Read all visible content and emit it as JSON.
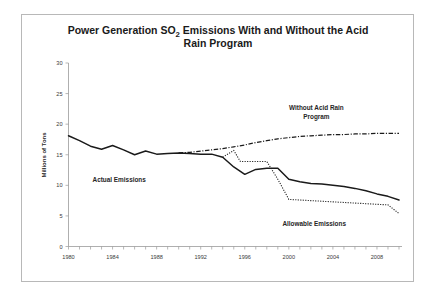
{
  "chart_data": {
    "type": "line",
    "title": "Power Generation SO2 Emissions With and Without the Acid Rain Program",
    "title_line1_pre": "Power Generation SO",
    "title_line1_sub": "2",
    "title_line1_post": " Emissions With and Without the Acid",
    "title_line2": "Rain Program",
    "xlabel": "",
    "ylabel": "Millions of Tons",
    "xlim": [
      1980,
      2010
    ],
    "ylim": [
      0,
      30
    ],
    "yticks": [
      0,
      5,
      10,
      15,
      20,
      25,
      30
    ],
    "ytick_labels": [
      "0",
      "5",
      "10",
      "15",
      "20",
      "25",
      "30"
    ],
    "xticks": [
      1980,
      1981,
      1982,
      1983,
      1984,
      1985,
      1986,
      1987,
      1988,
      1989,
      1990,
      1991,
      1992,
      1993,
      1994,
      1995,
      1996,
      1997,
      1998,
      1999,
      2000,
      2001,
      2002,
      2003,
      2004,
      2005,
      2006,
      2007,
      2008,
      2009,
      2010
    ],
    "xtick_labels_shown": [
      "1980",
      "1984",
      "1988",
      "1992",
      "1996",
      "2000",
      "2004",
      "2008"
    ],
    "xtick_label_years": [
      1980,
      1984,
      1988,
      1992,
      1996,
      2000,
      2004,
      2008
    ],
    "grid": false,
    "legend": "annotations",
    "series": [
      {
        "name": "Actual Emissions",
        "style": "solid",
        "annotation": "Actual Emissions",
        "annotation_x": 1984.6,
        "annotation_y": 10.5,
        "x": [
          1980,
          1981,
          1982,
          1983,
          1984,
          1985,
          1986,
          1987,
          1988,
          1989,
          1990,
          1991,
          1992,
          1993,
          1994,
          1995,
          1996,
          1997,
          1998,
          1999,
          2000,
          2001,
          2002,
          2003,
          2004,
          2005,
          2006,
          2007,
          2008,
          2009,
          2010
        ],
        "y": [
          18.1,
          17.3,
          16.4,
          15.9,
          16.5,
          15.8,
          15.0,
          15.6,
          15.1,
          15.2,
          15.3,
          15.2,
          15.1,
          15.1,
          14.6,
          13.0,
          11.8,
          12.6,
          12.8,
          12.8,
          11.0,
          10.6,
          10.3,
          10.2,
          10.0,
          9.8,
          9.5,
          9.1,
          8.6,
          8.2,
          7.6
        ]
      },
      {
        "name": "Without Acid Rain Program",
        "style": "dash-dot",
        "annotation_line1": "Without Acid Rain",
        "annotation_line2": "Program",
        "annotation_x": 2002.5,
        "annotation_y": 22.3,
        "x": [
          1990,
          1991,
          1992,
          1993,
          1994,
          1995,
          1996,
          1997,
          1998,
          1999,
          2000,
          2001,
          2002,
          2003,
          2004,
          2005,
          2006,
          2007,
          2008,
          2009,
          2010
        ],
        "y": [
          15.3,
          15.4,
          15.6,
          15.8,
          16.0,
          16.3,
          16.6,
          17.0,
          17.3,
          17.6,
          17.8,
          18.0,
          18.1,
          18.2,
          18.3,
          18.3,
          18.4,
          18.4,
          18.5,
          18.5,
          18.5
        ]
      },
      {
        "name": "Allowable Emissions",
        "style": "dotted",
        "annotation": "Allowable Emissions",
        "annotation_x": 2002.3,
        "annotation_y": 3.3,
        "x": [
          1994,
          1995,
          1995.6,
          1996,
          1997,
          1998,
          1999,
          2000,
          2001,
          2002,
          2003,
          2004,
          2005,
          2006,
          2007,
          2008,
          2009,
          2010
        ],
        "y": [
          14.6,
          15.7,
          13.9,
          13.9,
          13.9,
          13.9,
          11.0,
          7.7,
          7.6,
          7.5,
          7.4,
          7.3,
          7.2,
          7.1,
          7.0,
          6.9,
          6.8,
          5.4
        ]
      }
    ]
  },
  "colors": {
    "line": "#1a1a1a",
    "axis": "#9a9a9a",
    "frame": "#b8b8b8",
    "background": "#ffffff",
    "text": "#262626"
  }
}
